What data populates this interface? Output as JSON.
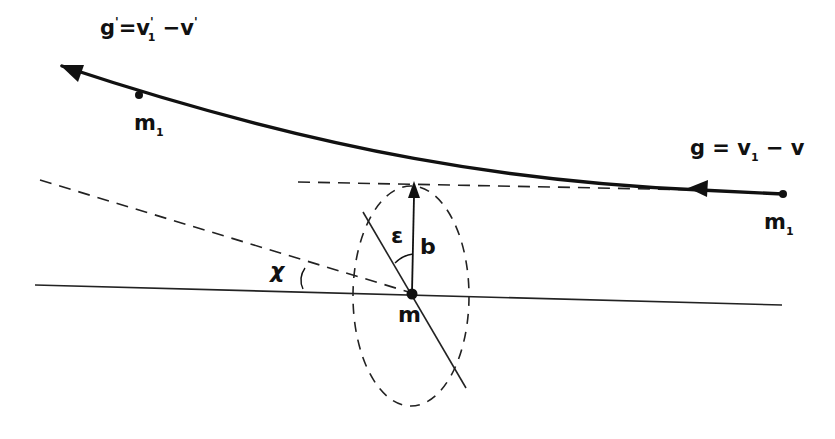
{
  "diagram": {
    "type": "collision-geometry",
    "colors": {
      "ink": "#111111",
      "background": "#ffffff"
    },
    "labels": {
      "g_after": {
        "main": "g",
        "prime1": "'",
        "eq": "=v",
        "sub1": "1",
        "prime2": "'",
        "minus": " −v",
        "prime3": "'"
      },
      "g_before": {
        "main": "g = v",
        "sub1": "1",
        "rest": " − v"
      },
      "m1_left": {
        "main": "m",
        "sub": "1"
      },
      "m1_right": {
        "main": "m",
        "sub": "1"
      },
      "m_center": "m",
      "epsilon": "ε",
      "b": "b",
      "chi": "χ"
    },
    "elements": [
      {
        "id": "trajectory",
        "kind": "curve",
        "style": "thick-solid",
        "from": [
          783,
          194
        ],
        "to": [
          62,
          66
        ],
        "arrowheads": [
          "left-end",
          "mid-right"
        ]
      },
      {
        "id": "reference-line",
        "kind": "line",
        "style": "thin-solid",
        "from": [
          35,
          285
        ],
        "to": [
          782,
          305
        ]
      },
      {
        "id": "asymptote-in",
        "kind": "line",
        "style": "dashed",
        "from": [
          298,
          182
        ],
        "to": [
          700,
          190
        ]
      },
      {
        "id": "asymptote-out",
        "kind": "line",
        "style": "dashed",
        "from": [
          40,
          180
        ],
        "to": [
          412,
          293
        ]
      },
      {
        "id": "impact-parameter",
        "kind": "arrow",
        "label": "b",
        "from": [
          412,
          293
        ],
        "to": [
          414,
          183
        ]
      },
      {
        "id": "apse-line",
        "kind": "line",
        "style": "thin-solid",
        "from": [
          363,
          210
        ],
        "to": [
          466,
          390
        ]
      },
      {
        "id": "ellipse",
        "kind": "ellipse",
        "style": "dashed",
        "center": [
          411,
          296
        ],
        "rx": 58,
        "ry": 110
      },
      {
        "id": "angle-epsilon",
        "kind": "arc",
        "label": "ε"
      },
      {
        "id": "angle-chi",
        "kind": "arc",
        "label": "χ"
      }
    ]
  }
}
